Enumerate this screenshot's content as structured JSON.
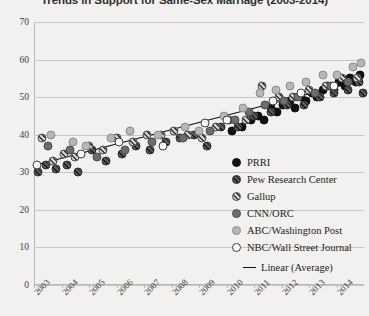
{
  "chart_data": {
    "type": "scatter",
    "title": "Trends in Support for Same-Sex Marriage (2003-2014)",
    "xlabel": "",
    "ylabel": "",
    "xlim": [
      2003,
      2015
    ],
    "ylim": [
      0,
      70
    ],
    "grid": true,
    "legend_position": "right-inside",
    "categories": [
      "2003",
      "2004",
      "2005",
      "2006",
      "2007",
      "2008",
      "2009",
      "2010",
      "2011",
      "2012",
      "2013",
      "2014"
    ],
    "yticks": [
      0,
      10,
      20,
      30,
      40,
      50,
      60,
      70
    ],
    "series": [
      {
        "name": "PRRI",
        "marker": "solid-black",
        "color": "#101010",
        "points": [
          [
            2010.55,
            42
          ],
          [
            2010.9,
            44
          ],
          [
            2011.15,
            45
          ],
          [
            2011.35,
            44
          ],
          [
            2011.6,
            47
          ],
          [
            2011.85,
            46
          ],
          [
            2012.05,
            48
          ],
          [
            2012.3,
            49
          ],
          [
            2012.5,
            47
          ],
          [
            2012.7,
            50
          ],
          [
            2012.9,
            49
          ],
          [
            2013.1,
            51
          ],
          [
            2013.3,
            50
          ],
          [
            2013.5,
            52
          ],
          [
            2013.7,
            53
          ],
          [
            2013.9,
            52
          ],
          [
            2014.1,
            54
          ],
          [
            2014.3,
            53
          ],
          [
            2014.5,
            55
          ],
          [
            2014.7,
            54
          ],
          [
            2014.85,
            56
          ],
          [
            2010.2,
            41
          ]
        ]
      },
      {
        "name": "Pew Research Center",
        "marker": "dark-hatch",
        "color": "#5c5c5c",
        "points": [
          [
            2003.15,
            30
          ],
          [
            2003.45,
            32
          ],
          [
            2003.8,
            31
          ],
          [
            2004.2,
            32
          ],
          [
            2004.6,
            30
          ],
          [
            2005.1,
            36
          ],
          [
            2005.6,
            33
          ],
          [
            2006.2,
            35
          ],
          [
            2006.7,
            37
          ],
          [
            2007.2,
            36
          ],
          [
            2007.8,
            38
          ],
          [
            2008.3,
            39
          ],
          [
            2008.8,
            40
          ],
          [
            2009.3,
            37
          ],
          [
            2009.8,
            42
          ],
          [
            2010.4,
            42
          ],
          [
            2011.0,
            45
          ],
          [
            2011.6,
            46
          ],
          [
            2012.2,
            48
          ],
          [
            2012.8,
            48
          ],
          [
            2013.4,
            50
          ],
          [
            2013.9,
            51
          ],
          [
            2014.4,
            52
          ],
          [
            2014.8,
            54
          ],
          [
            2014.95,
            51
          ]
        ]
      },
      {
        "name": "Gallup",
        "marker": "light-hatch",
        "color": "#d2d0cd",
        "points": [
          [
            2003.3,
            39
          ],
          [
            2003.7,
            33
          ],
          [
            2004.1,
            35
          ],
          [
            2004.5,
            34
          ],
          [
            2005.0,
            37
          ],
          [
            2005.5,
            36
          ],
          [
            2006.0,
            39
          ],
          [
            2006.6,
            38
          ],
          [
            2007.1,
            40
          ],
          [
            2007.6,
            40
          ],
          [
            2008.1,
            41
          ],
          [
            2008.6,
            40
          ],
          [
            2009.1,
            39
          ],
          [
            2009.6,
            42
          ],
          [
            2010.1,
            44
          ],
          [
            2010.7,
            44
          ],
          [
            2011.3,
            53
          ],
          [
            2011.9,
            50
          ],
          [
            2012.4,
            50
          ],
          [
            2013.0,
            52
          ],
          [
            2013.6,
            53
          ],
          [
            2014.2,
            55
          ],
          [
            2014.75,
            55
          ]
        ]
      },
      {
        "name": "CNN/ORC",
        "marker": "mid-gray",
        "color": "#6d6d6d",
        "points": [
          [
            2003.5,
            37
          ],
          [
            2004.3,
            36
          ],
          [
            2005.3,
            34
          ],
          [
            2006.3,
            36
          ],
          [
            2007.3,
            38
          ],
          [
            2008.4,
            39
          ],
          [
            2009.4,
            41
          ],
          [
            2010.3,
            44
          ],
          [
            2010.8,
            46
          ],
          [
            2011.4,
            48
          ],
          [
            2012.1,
            49
          ],
          [
            2012.6,
            50
          ],
          [
            2013.2,
            51
          ],
          [
            2013.8,
            53
          ],
          [
            2014.4,
            54
          ]
        ]
      },
      {
        "name": "ABC/Washington Post",
        "marker": "light-gray",
        "color": "#b9b7b4",
        "points": [
          [
            2003.6,
            40
          ],
          [
            2004.4,
            38
          ],
          [
            2004.9,
            37
          ],
          [
            2005.8,
            39
          ],
          [
            2006.5,
            41
          ],
          [
            2007.5,
            40
          ],
          [
            2008.5,
            42
          ],
          [
            2009.0,
            41
          ],
          [
            2009.9,
            45
          ],
          [
            2010.6,
            47
          ],
          [
            2011.2,
            51
          ],
          [
            2011.8,
            52
          ],
          [
            2012.3,
            53
          ],
          [
            2012.9,
            54
          ],
          [
            2013.5,
            56
          ],
          [
            2014.0,
            56
          ],
          [
            2014.6,
            58
          ],
          [
            2014.9,
            59
          ]
        ]
      },
      {
        "name": "NBC/Wall Street Journal",
        "marker": "open-white",
        "color": "#fbfbfa",
        "points": [
          [
            2003.1,
            32
          ],
          [
            2004.7,
            35
          ],
          [
            2006.1,
            38
          ],
          [
            2007.7,
            37
          ],
          [
            2009.2,
            43
          ],
          [
            2010.0,
            44
          ],
          [
            2011.7,
            49
          ],
          [
            2012.7,
            51
          ],
          [
            2013.9,
            53
          ]
        ]
      }
    ],
    "trendline": {
      "name": "Linear (Average)",
      "style": "solid",
      "color": "#111111",
      "x_start": 2003.1,
      "y_start": 32.0,
      "x_end": 2014.9,
      "y_end": 54.5
    }
  },
  "legend": {
    "items": [
      {
        "label": "PRRI",
        "marker_class": "m-prri"
      },
      {
        "label": "Pew Research Center",
        "marker_class": "m-pew"
      },
      {
        "label": "Gallup",
        "marker_class": "m-gallup"
      },
      {
        "label": "CNN/ORC",
        "marker_class": "m-cnn"
      },
      {
        "label": "ABC/Washington Post",
        "marker_class": "m-abc"
      },
      {
        "label": "NBC/Wall Street Journal",
        "marker_class": "m-nbc"
      }
    ],
    "trend_label": "Linear (Average)"
  }
}
